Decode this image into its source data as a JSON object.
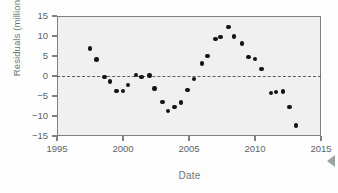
{
  "chart_data": {
    "type": "scatter",
    "title": "",
    "xlabel": "Date",
    "ylabel": "Residuals (millions)",
    "xlim": [
      1995,
      2015
    ],
    "ylim": [
      -15,
      15
    ],
    "xticks": [
      "1995",
      "2000",
      "2005",
      "2010",
      "2015"
    ],
    "yticks": [
      "15",
      "10",
      "5",
      "0",
      "-5",
      "-10",
      "-15"
    ],
    "grid": false,
    "legend": null,
    "reference_line": {
      "name": "zero-line",
      "y": 0,
      "style": "dashed"
    },
    "series": [
      {
        "name": "Residuals",
        "marker": "filled-circle",
        "color": "#141414",
        "points": [
          {
            "x": 1997.5,
            "y": 6.9
          },
          {
            "x": 1998.0,
            "y": 4.1
          },
          {
            "x": 1998.6,
            "y": -0.2
          },
          {
            "x": 1999.0,
            "y": -1.4
          },
          {
            "x": 1999.5,
            "y": -3.8
          },
          {
            "x": 2000.0,
            "y": -3.7
          },
          {
            "x": 2000.4,
            "y": -2.3
          },
          {
            "x": 2001.0,
            "y": 0.3
          },
          {
            "x": 2001.4,
            "y": -0.2
          },
          {
            "x": 2002.0,
            "y": 0.1
          },
          {
            "x": 2002.4,
            "y": -3.1
          },
          {
            "x": 2003.0,
            "y": -6.5
          },
          {
            "x": 2003.4,
            "y": -8.8
          },
          {
            "x": 2003.9,
            "y": -7.7
          },
          {
            "x": 2004.4,
            "y": -6.6
          },
          {
            "x": 2004.9,
            "y": -3.5
          },
          {
            "x": 2005.4,
            "y": -0.7
          },
          {
            "x": 2006.0,
            "y": 3.1
          },
          {
            "x": 2006.4,
            "y": 5.0
          },
          {
            "x": 2007.0,
            "y": 9.2
          },
          {
            "x": 2007.4,
            "y": 9.8
          },
          {
            "x": 2008.0,
            "y": 12.2
          },
          {
            "x": 2008.4,
            "y": 9.9
          },
          {
            "x": 2009.0,
            "y": 8.1
          },
          {
            "x": 2009.5,
            "y": 4.8
          },
          {
            "x": 2010.0,
            "y": 4.2
          },
          {
            "x": 2010.5,
            "y": 1.7
          },
          {
            "x": 2011.2,
            "y": -4.3
          },
          {
            "x": 2011.6,
            "y": -4.0
          },
          {
            "x": 2012.1,
            "y": -3.9
          },
          {
            "x": 2012.6,
            "y": -7.7
          },
          {
            "x": 2013.1,
            "y": -12.4
          }
        ]
      }
    ]
  },
  "colors": {
    "marker": "#141414",
    "axis": "#7a8084",
    "plot_background": "#f0f0f0",
    "label_text": "#6e7577",
    "tick_text": "#5c6365"
  }
}
